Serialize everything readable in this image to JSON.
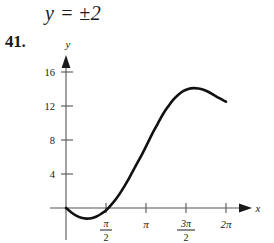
{
  "equation": {
    "text": "y = ±2"
  },
  "problem": {
    "number": "41."
  },
  "axes": {
    "x_axis_label": "x",
    "y_axis_label": "y"
  },
  "chart_data": {
    "type": "line",
    "title": "",
    "xlabel": "x",
    "ylabel": "y",
    "xlim": [
      -0.35,
      7.2
    ],
    "ylim": [
      -2.6,
      18.5
    ],
    "grid": false,
    "legend": null,
    "x_tick_labels": [
      "π/2",
      "π",
      "3π/2",
      "2π"
    ],
    "x_tick_values": [
      1.5708,
      3.1416,
      4.7124,
      6.2832
    ],
    "x_tick_parts": [
      {
        "numerator": "π",
        "denominator": "2",
        "fraction": true
      },
      {
        "numerator": "π",
        "denominator": "",
        "fraction": false
      },
      {
        "numerator": "3π",
        "denominator": "2",
        "fraction": true
      },
      {
        "numerator": "2π",
        "denominator": "",
        "fraction": false
      }
    ],
    "y_tick_labels": [
      "4",
      "8",
      "12",
      "16"
    ],
    "y_tick_values": [
      4,
      8,
      12,
      16
    ],
    "series": [
      {
        "name": "curve",
        "x": [
          0.0,
          0.2,
          0.4,
          0.6,
          0.8,
          1.0,
          1.2,
          1.4,
          1.6,
          1.8,
          2.0,
          2.2,
          2.4,
          2.6,
          2.8,
          3.0,
          3.2,
          3.4,
          3.6,
          3.8,
          4.0,
          4.2,
          4.4,
          4.6,
          4.8,
          5.0,
          5.2,
          5.4,
          5.6,
          5.8,
          6.0,
          6.2832
        ],
        "y": [
          0.0,
          -0.5,
          -0.9,
          -1.15,
          -1.25,
          -1.2,
          -1.0,
          -0.65,
          -0.2,
          0.45,
          1.2,
          2.1,
          3.1,
          4.2,
          5.3,
          6.4,
          7.6,
          8.8,
          9.9,
          11.0,
          11.9,
          12.7,
          13.3,
          13.75,
          14.0,
          14.1,
          14.05,
          13.9,
          13.65,
          13.3,
          12.95,
          12.5
        ]
      }
    ]
  }
}
